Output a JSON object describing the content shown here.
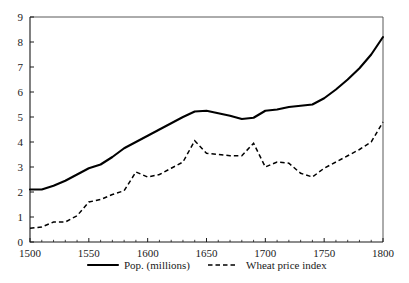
{
  "chart_data": {
    "type": "line",
    "title": "",
    "subtitle": "",
    "xlabel": "",
    "ylabel": "",
    "xlim": [
      1500,
      1800
    ],
    "ylim": [
      0,
      9
    ],
    "grid": false,
    "legend_position": "bottom",
    "x_ticks_major": [
      1500,
      1550,
      1600,
      1650,
      1700,
      1750,
      1800
    ],
    "x_tick_labels": [
      "1500",
      "1550",
      "1600",
      "1650",
      "1700",
      "1750",
      "1800"
    ],
    "x_tick_minor_step": 10,
    "y_ticks": [
      0,
      1,
      2,
      3,
      4,
      5,
      6,
      7,
      8,
      9
    ],
    "y_tick_labels": [
      "0",
      "1",
      "2",
      "3",
      "4",
      "5",
      "6",
      "7",
      "8",
      "9"
    ],
    "x": [
      1500,
      1510,
      1520,
      1530,
      1540,
      1550,
      1560,
      1570,
      1580,
      1590,
      1600,
      1610,
      1620,
      1630,
      1640,
      1650,
      1660,
      1670,
      1680,
      1690,
      1700,
      1710,
      1720,
      1730,
      1740,
      1750,
      1760,
      1770,
      1780,
      1790,
      1800
    ],
    "series": [
      {
        "name": "Pop. (millions)",
        "style": "solid",
        "color": "#000000",
        "values": [
          2.1,
          2.1,
          2.25,
          2.45,
          2.7,
          2.95,
          3.1,
          3.4,
          3.75,
          4.0,
          4.25,
          4.5,
          4.75,
          5.0,
          5.22,
          5.25,
          5.15,
          5.05,
          4.92,
          4.97,
          5.25,
          5.3,
          5.4,
          5.45,
          5.5,
          5.75,
          6.1,
          6.5,
          6.95,
          7.5,
          8.2
        ]
      },
      {
        "name": "Wheat price index",
        "style": "dashed",
        "color": "#000000",
        "values": [
          0.55,
          0.6,
          0.8,
          0.8,
          1.05,
          1.6,
          1.7,
          1.9,
          2.05,
          2.8,
          2.6,
          2.7,
          2.95,
          3.2,
          4.05,
          3.55,
          3.5,
          3.45,
          3.45,
          3.95,
          3.0,
          3.2,
          3.15,
          2.75,
          2.6,
          2.95,
          3.2,
          3.45,
          3.7,
          4.0,
          4.8
        ]
      }
    ],
    "legend": [
      {
        "label": "Pop. (millions)",
        "style": "solid"
      },
      {
        "label": "Wheat price index",
        "style": "dashed"
      }
    ]
  },
  "axes": {
    "plot_left_px": 30,
    "plot_right_px": 383,
    "plot_top_px": 17,
    "plot_bottom_px": 242
  }
}
